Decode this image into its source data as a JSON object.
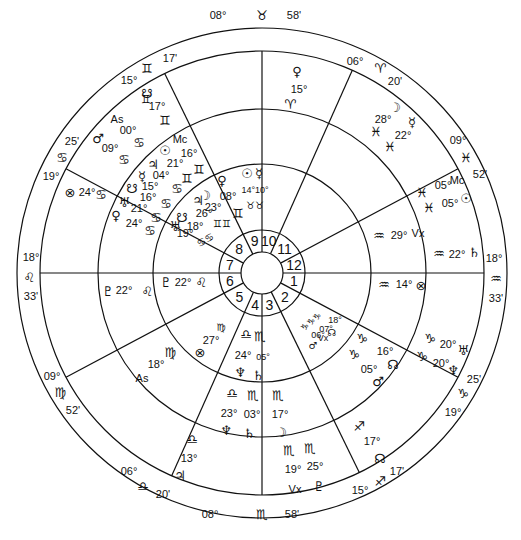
{
  "chart_title": "Bi-wheel natal/transit horoscope",
  "colors": {
    "line": "#111111",
    "background": "#ffffff",
    "text": "#111111"
  },
  "geometry": {
    "cx": 262,
    "cy": 273,
    "r_outer": 245,
    "r_sign": 222,
    "r_outer_planets": 164,
    "r_inner_planets": 109,
    "r_house_nums": 43,
    "r_center": 21
  },
  "house_numbers": [
    "1",
    "2",
    "3",
    "4",
    "5",
    "6",
    "7",
    "8",
    "9",
    "10",
    "11",
    "12"
  ],
  "cusps": [
    {
      "house": 10,
      "deg": "08°",
      "sign": "♉",
      "min": "58'",
      "angle": 90,
      "label_pos": [
        262,
        16
      ],
      "layout": "row"
    },
    {
      "house": 11,
      "deg": "06°",
      "sign": "♈",
      "min": "20'",
      "angle": 66
    },
    {
      "house": 12,
      "deg": "09°",
      "sign": "♓",
      "min": "52'",
      "angle": 28
    },
    {
      "house": 1,
      "deg": "18°",
      "sign": "♒",
      "min": "33'",
      "angle": 0
    },
    {
      "house": 2,
      "deg": "19°",
      "sign": "♑",
      "min": "25'",
      "angle": -28
    },
    {
      "house": 3,
      "deg": "15°",
      "sign": "♐",
      "min": "17'",
      "angle": -64
    },
    {
      "house": 4,
      "deg": "08°",
      "sign": "♏",
      "min": "58'",
      "angle": -90
    },
    {
      "house": 5,
      "deg": "06°",
      "sign": "♎",
      "min": "20'",
      "angle": -114
    },
    {
      "house": 6,
      "deg": "09°",
      "sign": "♍",
      "min": "52'",
      "angle": -152
    },
    {
      "house": 7,
      "deg": "18°",
      "sign": "♌",
      "min": "33'",
      "angle": 180
    },
    {
      "house": 8,
      "deg": "19°",
      "sign": "♋",
      "min": "25'",
      "angle": 152
    },
    {
      "house": 9,
      "deg": "15°",
      "sign": "♊",
      "min": "17'",
      "angle": 116
    }
  ],
  "outer_planets": [
    {
      "glyph": "♀",
      "deg": "15°",
      "sign": "♈",
      "x": 297,
      "y": 73
    },
    {
      "glyph": "☽",
      "deg": "28°",
      "sign": "♓",
      "x": 392,
      "y": 108
    },
    {
      "glyph": "☿",
      "deg": "22°",
      "sign": "♓",
      "x": 412,
      "y": 125
    },
    {
      "glyph": "Mc",
      "deg": "05°",
      "sign": "♓",
      "x": 440,
      "y": 183
    },
    {
      "glyph": "☉",
      "deg": "05°",
      "sign": "♓",
      "x": 447,
      "y": 200
    },
    {
      "glyph": "♄",
      "deg": "22°",
      "sign": "♒",
      "x": 450,
      "y": 255
    },
    {
      "glyph": "⊗",
      "deg": "14°",
      "sign": "♒",
      "x": 425,
      "y": 283
    },
    {
      "glyph": "♅",
      "deg": "20°",
      "sign": "♑",
      "x": 432,
      "y": 350
    },
    {
      "glyph": "♆",
      "deg": "20°",
      "sign": "♑",
      "x": 427,
      "y": 370
    },
    {
      "glyph": "☊",
      "deg": "17°",
      "sign": "♐",
      "x": 378,
      "y": 455
    },
    {
      "glyph": "♇",
      "deg": "25°",
      "sign": "♏",
      "x": 320,
      "y": 487
    },
    {
      "glyph": "Vx",
      "deg": "19°",
      "sign": "♏",
      "x": 290,
      "y": 490
    },
    {
      "glyph": "♃",
      "deg": "13°",
      "sign": "♎",
      "x": 180,
      "y": 462
    },
    {
      "glyph": "As",
      "deg": "18°",
      "sign": "♍",
      "x": 143,
      "y": 380
    },
    {
      "glyph": "♇",
      "deg": "22°",
      "sign": "♌",
      "x": 110,
      "y": 285
    },
    {
      "glyph": "⊗",
      "deg": "24°",
      "sign": "♋",
      "x": 70,
      "y": 193
    },
    {
      "glyph": "♂",
      "deg": "09°",
      "sign": "♋",
      "x": 96,
      "y": 143
    },
    {
      "glyph": "As",
      "deg": "00°",
      "sign": "♋",
      "x": 112,
      "y": 123
    },
    {
      "glyph": "☋",
      "deg": "17°",
      "sign": "♊",
      "x": 146,
      "y": 95
    }
  ],
  "inner_planets": [
    {
      "glyph": "Mc",
      "deg": "16°",
      "sign": "♊"
    },
    {
      "glyph": "☉",
      "deg": "16°",
      "sign": "♊"
    },
    {
      "glyph": "♃",
      "deg": "21°",
      "sign": "♋"
    },
    {
      "glyph": "☿",
      "deg": "04°",
      "sign": "♋"
    },
    {
      "glyph": "☋",
      "deg": "15°",
      "sign": "♋"
    },
    {
      "glyph": "♅",
      "deg": "21°",
      "sign": "♋"
    },
    {
      "glyph": "♀",
      "deg": "24°",
      "sign": "♋"
    },
    {
      "glyph": "☋",
      "deg": "18°",
      "sign": "♋"
    },
    {
      "glyph": "♅",
      "deg": "19°",
      "sign": "♋"
    },
    {
      "glyph": "☽",
      "deg": "23°",
      "sign": "♊"
    },
    {
      "glyph": "♃",
      "deg": "26°",
      "sign": "♊"
    },
    {
      "glyph": "♀",
      "deg": "08°",
      "sign": "♊"
    },
    {
      "glyph": "☉",
      "deg": "14°",
      "sign": "♉"
    },
    {
      "glyph": "☿",
      "deg": "10°",
      "sign": "♉"
    },
    {
      "glyph": "Vx",
      "deg": "29°",
      "sign": "♒"
    },
    {
      "glyph": "☊",
      "deg": "16°",
      "sign": "♑"
    },
    {
      "glyph": "♂",
      "deg": "05°",
      "sign": "♑"
    },
    {
      "glyph": "☊",
      "deg": "18°",
      "sign": "♑"
    },
    {
      "glyph": "Vx",
      "deg": "07°",
      "sign": "♑"
    },
    {
      "glyph": "♂",
      "deg": "06°",
      "sign": "♑"
    },
    {
      "glyph": "☽",
      "deg": "17°",
      "sign": "♏"
    },
    {
      "glyph": "♆",
      "deg": "23°",
      "sign": "♎"
    },
    {
      "glyph": "♄",
      "deg": "03°",
      "sign": "♏"
    },
    {
      "glyph": "♆",
      "deg": "24°",
      "sign": "♎"
    },
    {
      "glyph": "♄",
      "deg": "05°",
      "sign": "♏"
    },
    {
      "glyph": "⊗",
      "deg": "27°",
      "sign": "♍"
    },
    {
      "glyph": "♇",
      "deg": "22°",
      "sign": "♌"
    }
  ],
  "labels": [
    {
      "t": "08°",
      "x": 218,
      "y": 19,
      "cls": ""
    },
    {
      "t": "♉",
      "x": 262,
      "y": 20,
      "cls": "glyph"
    },
    {
      "t": "58'",
      "x": 294,
      "y": 19,
      "cls": ""
    },
    {
      "t": "06°",
      "x": 355,
      "y": 65,
      "cls": ""
    },
    {
      "t": "♈",
      "x": 380,
      "y": 73,
      "cls": "glyph"
    },
    {
      "t": "20'",
      "x": 395,
      "y": 85,
      "cls": ""
    },
    {
      "t": "09°",
      "x": 458,
      "y": 144,
      "cls": ""
    },
    {
      "t": "♓",
      "x": 466,
      "y": 162,
      "cls": "glyph"
    },
    {
      "t": "52'",
      "x": 480,
      "y": 178,
      "cls": ""
    },
    {
      "t": "18°",
      "x": 494,
      "y": 262,
      "cls": ""
    },
    {
      "t": "♒",
      "x": 496,
      "y": 283,
      "cls": "glyph"
    },
    {
      "t": "33'",
      "x": 496,
      "y": 302,
      "cls": ""
    },
    {
      "t": "25'",
      "x": 474,
      "y": 383,
      "cls": ""
    },
    {
      "t": "♑",
      "x": 463,
      "y": 398,
      "cls": "glyph"
    },
    {
      "t": "19°",
      "x": 453,
      "y": 416,
      "cls": ""
    },
    {
      "t": "17'",
      "x": 397,
      "y": 475,
      "cls": ""
    },
    {
      "t": "♐",
      "x": 380,
      "y": 486,
      "cls": "glyph"
    },
    {
      "t": "15°",
      "x": 360,
      "y": 494,
      "cls": ""
    },
    {
      "t": "08°",
      "x": 210,
      "y": 518,
      "cls": ""
    },
    {
      "t": "♏",
      "x": 262,
      "y": 519,
      "cls": "glyph"
    },
    {
      "t": "58'",
      "x": 292,
      "y": 518,
      "cls": ""
    },
    {
      "t": "06°",
      "x": 129,
      "y": 475,
      "cls": ""
    },
    {
      "t": "♎",
      "x": 143,
      "y": 491,
      "cls": "glyph"
    },
    {
      "t": "20'",
      "x": 163,
      "y": 498,
      "cls": ""
    },
    {
      "t": "09°",
      "x": 52,
      "y": 380,
      "cls": ""
    },
    {
      "t": "♍",
      "x": 60,
      "y": 397,
      "cls": "glyph"
    },
    {
      "t": "52'",
      "x": 73,
      "y": 414,
      "cls": ""
    },
    {
      "t": "18°",
      "x": 31,
      "y": 261,
      "cls": ""
    },
    {
      "t": "♌",
      "x": 29,
      "y": 282,
      "cls": "glyph"
    },
    {
      "t": "33'",
      "x": 31,
      "y": 300,
      "cls": ""
    },
    {
      "t": "25'",
      "x": 72,
      "y": 145,
      "cls": ""
    },
    {
      "t": "♋",
      "x": 62,
      "y": 162,
      "cls": "glyph"
    },
    {
      "t": "19°",
      "x": 51,
      "y": 180,
      "cls": ""
    },
    {
      "t": "17'",
      "x": 170,
      "y": 62,
      "cls": ""
    },
    {
      "t": "♊",
      "x": 147,
      "y": 73,
      "cls": "glyph"
    },
    {
      "t": "15°",
      "x": 129,
      "y": 84,
      "cls": ""
    },
    {
      "t": "♀",
      "x": 297,
      "y": 76,
      "cls": "glyph"
    },
    {
      "t": "15°",
      "x": 299,
      "y": 93,
      "cls": ""
    },
    {
      "t": "♈",
      "x": 290,
      "y": 109,
      "cls": "glyph"
    },
    {
      "t": "☽",
      "x": 395,
      "y": 112,
      "cls": "glyph"
    },
    {
      "t": "28°",
      "x": 383,
      "y": 123,
      "cls": ""
    },
    {
      "t": "☿",
      "x": 412,
      "y": 127,
      "cls": "glyph"
    },
    {
      "t": "♓",
      "x": 376,
      "y": 136,
      "cls": "glyph"
    },
    {
      "t": "22°",
      "x": 403,
      "y": 139,
      "cls": ""
    },
    {
      "t": "♓",
      "x": 390,
      "y": 151,
      "cls": "glyph"
    },
    {
      "t": "♓",
      "x": 422,
      "y": 197,
      "cls": "glyph"
    },
    {
      "t": "05°",
      "x": 443,
      "y": 189,
      "cls": ""
    },
    {
      "t": "Mc",
      "x": 457,
      "y": 184,
      "cls": ""
    },
    {
      "t": "♓",
      "x": 429,
      "y": 212,
      "cls": "glyph"
    },
    {
      "t": "05°",
      "x": 450,
      "y": 207,
      "cls": ""
    },
    {
      "t": "☉",
      "x": 466,
      "y": 203,
      "cls": "glyph"
    },
    {
      "t": "♒",
      "x": 379,
      "y": 240,
      "cls": "glyph"
    },
    {
      "t": "29°",
      "x": 399,
      "y": 239,
      "cls": ""
    },
    {
      "t": "Vx",
      "x": 418,
      "y": 237,
      "cls": ""
    },
    {
      "t": "♒",
      "x": 439,
      "y": 258,
      "cls": "glyph"
    },
    {
      "t": "22°",
      "x": 457,
      "y": 258,
      "cls": ""
    },
    {
      "t": "♄",
      "x": 474,
      "y": 257,
      "cls": "glyph"
    },
    {
      "t": "♒",
      "x": 384,
      "y": 289,
      "cls": "glyph"
    },
    {
      "t": "14°",
      "x": 404,
      "y": 288,
      "cls": ""
    },
    {
      "t": "⊗",
      "x": 421,
      "y": 290,
      "cls": "glyph"
    },
    {
      "t": "♑",
      "x": 430,
      "y": 343,
      "cls": "glyph"
    },
    {
      "t": "20°",
      "x": 448,
      "y": 348,
      "cls": ""
    },
    {
      "t": "♅",
      "x": 463,
      "y": 355,
      "cls": "glyph"
    },
    {
      "t": "♑",
      "x": 422,
      "y": 361,
      "cls": "glyph"
    },
    {
      "t": "20°",
      "x": 441,
      "y": 367,
      "cls": ""
    },
    {
      "t": "♆",
      "x": 453,
      "y": 375,
      "cls": "glyph"
    },
    {
      "t": "♑",
      "x": 362,
      "y": 343,
      "cls": "glyph"
    },
    {
      "t": "16°",
      "x": 385,
      "y": 355,
      "cls": ""
    },
    {
      "t": "☊",
      "x": 393,
      "y": 369,
      "cls": "glyph"
    },
    {
      "t": "♑",
      "x": 354,
      "y": 359,
      "cls": "glyph"
    },
    {
      "t": "05°",
      "x": 369,
      "y": 373,
      "cls": ""
    },
    {
      "t": "♂",
      "x": 378,
      "y": 386,
      "cls": "glyph"
    },
    {
      "t": "♑♑♑",
      "x": 313,
      "y": 324,
      "cls": "glyph",
      "size": 9,
      "rot": -40
    },
    {
      "t": "18°",
      "x": 335,
      "y": 323,
      "cls": "",
      "size": 9
    },
    {
      "t": "07°",
      "x": 326,
      "y": 332,
      "cls": "",
      "size": 9
    },
    {
      "t": "06°",
      "x": 318,
      "y": 338,
      "cls": "",
      "size": 9
    },
    {
      "t": "♂",
      "x": 313,
      "y": 349,
      "cls": "glyph",
      "size": 10
    },
    {
      "t": "Vx",
      "x": 323,
      "y": 341,
      "cls": "",
      "size": 9
    },
    {
      "t": "☊",
      "x": 332,
      "y": 336,
      "cls": "glyph",
      "size": 10
    },
    {
      "t": "♐",
      "x": 359,
      "y": 431,
      "cls": "glyph"
    },
    {
      "t": "17°",
      "x": 372,
      "y": 445,
      "cls": ""
    },
    {
      "t": "☊",
      "x": 380,
      "y": 463,
      "cls": "glyph"
    },
    {
      "t": "♏",
      "x": 278,
      "y": 400,
      "cls": "glyph"
    },
    {
      "t": "17°",
      "x": 280,
      "y": 418,
      "cls": ""
    },
    {
      "t": "☽",
      "x": 281,
      "y": 437,
      "cls": "glyph"
    },
    {
      "t": "♏",
      "x": 289,
      "y": 455,
      "cls": "glyph"
    },
    {
      "t": "♏",
      "x": 310,
      "y": 453,
      "cls": "glyph"
    },
    {
      "t": "19°",
      "x": 293,
      "y": 473,
      "cls": ""
    },
    {
      "t": "25°",
      "x": 315,
      "y": 470,
      "cls": ""
    },
    {
      "t": "Vx",
      "x": 295,
      "y": 493,
      "cls": ""
    },
    {
      "t": "♇",
      "x": 319,
      "y": 491,
      "cls": "glyph"
    },
    {
      "t": "♎",
      "x": 246,
      "y": 339,
      "cls": "glyph"
    },
    {
      "t": "♏",
      "x": 260,
      "y": 341,
      "cls": "glyph"
    },
    {
      "t": "24°",
      "x": 243,
      "y": 359,
      "cls": ""
    },
    {
      "t": "05°",
      "x": 263,
      "y": 360,
      "cls": "",
      "size": 9
    },
    {
      "t": "♆",
      "x": 240,
      "y": 377,
      "cls": "glyph"
    },
    {
      "t": "♄",
      "x": 258,
      "y": 380,
      "cls": "glyph"
    },
    {
      "t": "♎",
      "x": 232,
      "y": 398,
      "cls": "glyph"
    },
    {
      "t": "♏",
      "x": 253,
      "y": 400,
      "cls": "glyph"
    },
    {
      "t": "23°",
      "x": 229,
      "y": 417,
      "cls": ""
    },
    {
      "t": "03°",
      "x": 252,
      "y": 418,
      "cls": ""
    },
    {
      "t": "♆",
      "x": 226,
      "y": 435,
      "cls": "glyph"
    },
    {
      "t": "♄",
      "x": 249,
      "y": 438,
      "cls": "glyph"
    },
    {
      "t": "♎",
      "x": 192,
      "y": 444,
      "cls": "glyph"
    },
    {
      "t": "13°",
      "x": 189,
      "y": 462,
      "cls": ""
    },
    {
      "t": "♃",
      "x": 180,
      "y": 480,
      "cls": "glyph"
    },
    {
      "t": "♍",
      "x": 221,
      "y": 331,
      "cls": "glyph",
      "size": 10
    },
    {
      "t": "27°",
      "x": 211,
      "y": 344,
      "cls": ""
    },
    {
      "t": "⊗",
      "x": 200,
      "y": 357,
      "cls": "glyph"
    },
    {
      "t": "♍",
      "x": 170,
      "y": 357,
      "cls": "glyph"
    },
    {
      "t": "18°",
      "x": 156,
      "y": 368,
      "cls": ""
    },
    {
      "t": "As",
      "x": 142,
      "y": 382,
      "cls": ""
    },
    {
      "t": "♇",
      "x": 108,
      "y": 296,
      "cls": "glyph"
    },
    {
      "t": "22°",
      "x": 124,
      "y": 294,
      "cls": ""
    },
    {
      "t": "♌",
      "x": 147,
      "y": 296,
      "cls": "glyph"
    },
    {
      "t": "♇",
      "x": 166,
      "y": 287,
      "cls": "glyph"
    },
    {
      "t": "22°",
      "x": 183,
      "y": 286,
      "cls": ""
    },
    {
      "t": "♌",
      "x": 201,
      "y": 287,
      "cls": "glyph"
    },
    {
      "t": "⊗",
      "x": 70,
      "y": 197,
      "cls": "glyph"
    },
    {
      "t": "24°",
      "x": 87,
      "y": 196,
      "cls": ""
    },
    {
      "t": "♋",
      "x": 101,
      "y": 199,
      "cls": "glyph"
    },
    {
      "t": "♊",
      "x": 146,
      "y": 103,
      "cls": "glyph",
      "size": 11
    },
    {
      "t": "☋",
      "x": 148,
      "y": 97,
      "cls": "glyph",
      "skip": true
    },
    {
      "t": "☋",
      "x": 147,
      "y": 98,
      "cls": "glyph"
    },
    {
      "t": "17°",
      "x": 157,
      "y": 110,
      "cls": ""
    },
    {
      "t": "♊",
      "x": 165,
      "y": 125,
      "cls": "glyph"
    },
    {
      "t": "As",
      "x": 117,
      "y": 123,
      "cls": ""
    },
    {
      "t": "00°",
      "x": 128,
      "y": 134,
      "cls": ""
    },
    {
      "t": "♋",
      "x": 139,
      "y": 147,
      "cls": "glyph"
    },
    {
      "t": "♂",
      "x": 98,
      "y": 143,
      "cls": "glyph"
    },
    {
      "t": "09°",
      "x": 110,
      "y": 152,
      "cls": ""
    },
    {
      "t": "♋",
      "x": 124,
      "y": 164,
      "cls": "glyph"
    },
    {
      "t": "Mc",
      "x": 180,
      "y": 143,
      "cls": ""
    },
    {
      "t": "☉",
      "x": 165,
      "y": 155,
      "cls": "glyph"
    },
    {
      "t": "16°",
      "x": 189,
      "y": 157,
      "cls": ""
    },
    {
      "t": "♃",
      "x": 153,
      "y": 169,
      "cls": "glyph"
    },
    {
      "t": "21°",
      "x": 175,
      "y": 167,
      "cls": ""
    },
    {
      "t": "♊",
      "x": 199,
      "y": 174,
      "cls": "glyph"
    },
    {
      "t": "☿",
      "x": 142,
      "y": 181,
      "cls": "glyph"
    },
    {
      "t": "04°",
      "x": 161,
      "y": 179,
      "cls": ""
    },
    {
      "t": "♊",
      "x": 187,
      "y": 183,
      "cls": "glyph"
    },
    {
      "t": "15°",
      "x": 150,
      "y": 190,
      "cls": ""
    },
    {
      "t": "♋",
      "x": 177,
      "y": 193,
      "cls": "glyph"
    },
    {
      "t": "☋",
      "x": 132,
      "y": 193,
      "cls": "glyph"
    },
    {
      "t": "16°",
      "x": 148,
      "y": 201,
      "cls": ""
    },
    {
      "t": "♋",
      "x": 166,
      "y": 208,
      "cls": "glyph"
    },
    {
      "t": "♅",
      "x": 124,
      "y": 207,
      "cls": "glyph"
    },
    {
      "t": "21°",
      "x": 139,
      "y": 212,
      "cls": ""
    },
    {
      "t": "♋",
      "x": 156,
      "y": 222,
      "cls": "glyph"
    },
    {
      "t": "♀",
      "x": 116,
      "y": 220,
      "cls": "glyph"
    },
    {
      "t": "24°",
      "x": 134,
      "y": 227,
      "cls": ""
    },
    {
      "t": "♋",
      "x": 150,
      "y": 235,
      "cls": "glyph"
    },
    {
      "t": "♃",
      "x": 198,
      "y": 205,
      "cls": "glyph"
    },
    {
      "t": "☽",
      "x": 205,
      "y": 200,
      "cls": "glyph"
    },
    {
      "t": "23°",
      "x": 213,
      "y": 211,
      "cls": ""
    },
    {
      "t": "26°",
      "x": 204,
      "y": 217,
      "cls": ""
    },
    {
      "t": "♀",
      "x": 222,
      "y": 185,
      "cls": "glyph"
    },
    {
      "t": "08°",
      "x": 228,
      "y": 200,
      "cls": ""
    },
    {
      "t": "♊",
      "x": 238,
      "y": 218,
      "cls": "glyph"
    },
    {
      "t": "♊♊",
      "x": 222,
      "y": 227,
      "cls": "glyph",
      "size": 10
    },
    {
      "t": "☋",
      "x": 182,
      "y": 222,
      "cls": "glyph"
    },
    {
      "t": "18°",
      "x": 195,
      "y": 230,
      "cls": ""
    },
    {
      "t": "♅",
      "x": 175,
      "y": 231,
      "cls": "glyph"
    },
    {
      "t": "19°",
      "x": 185,
      "y": 237,
      "cls": ""
    },
    {
      "t": "♋♋",
      "x": 207,
      "y": 243,
      "cls": "glyph",
      "size": 10,
      "rot": -30
    },
    {
      "t": "☉",
      "x": 247,
      "y": 178,
      "cls": "glyph"
    },
    {
      "t": "☿",
      "x": 259,
      "y": 178,
      "cls": "glyph"
    },
    {
      "t": "14°10°",
      "x": 255,
      "y": 193,
      "cls": "",
      "size": 9
    },
    {
      "t": "♉♉",
      "x": 255,
      "y": 209,
      "cls": "glyph",
      "size": 10
    }
  ]
}
